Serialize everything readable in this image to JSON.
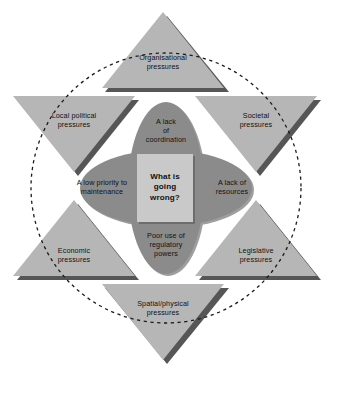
{
  "diagram": {
    "title": "What is going wrong?",
    "colors": {
      "triangle_fill": "#b6b6b6",
      "triangle_shadow": "#565656",
      "ellipse_fill": "#8b8b8b",
      "ellipse_shadow": "#5e5e5e",
      "core_fill": "#c9c9c9",
      "dashed_circle": "#1a1a1a",
      "background": "#ffffff",
      "text": "#111111"
    },
    "core": {
      "name": "core-question",
      "line1": "What is",
      "line2": "going",
      "line3": "wrong?"
    },
    "causes": [
      {
        "id": "lack-of-coordination",
        "position": "top",
        "line1": "A lack",
        "line2": "of",
        "line3": "coordination"
      },
      {
        "id": "lack-of-resources",
        "position": "right",
        "line1": "A lack of",
        "line2": "resources",
        "line3": ""
      },
      {
        "id": "poor-use-of-regulatory-powers",
        "position": "bottom",
        "line1": "Poor use of",
        "line2": "regulatory",
        "line3": "powers"
      },
      {
        "id": "low-priority-to-maintenance",
        "position": "left",
        "line1": "A low priority to",
        "line2": "maintenance",
        "line3": ""
      }
    ],
    "pressures": [
      {
        "id": "organisational-pressures",
        "position": "top",
        "orientation": "up",
        "line1": "Organisational",
        "line2": "pressures"
      },
      {
        "id": "societal-pressures",
        "position": "upper-right",
        "orientation": "down",
        "line1": "Societal",
        "line2": "pressures"
      },
      {
        "id": "legislative-pressures",
        "position": "lower-right",
        "orientation": "up",
        "line1": "Legislative",
        "line2": "pressures"
      },
      {
        "id": "spatial-physical-pressures",
        "position": "bottom",
        "orientation": "down",
        "line1": "Spatial/physical",
        "line2": "pressures"
      },
      {
        "id": "economic-pressures",
        "position": "lower-left",
        "orientation": "up",
        "line1": "Economic",
        "line2": "pressures"
      },
      {
        "id": "local-political-pressures",
        "position": "upper-left",
        "orientation": "down",
        "line1": "Local political",
        "line2": "pressures"
      }
    ]
  }
}
